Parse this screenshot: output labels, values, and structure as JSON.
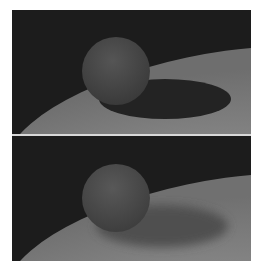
{
  "figure": {
    "panels": [
      {
        "id": "top",
        "description": "Sphere above ground plane with hard, dark shadow",
        "shadow_style": "hard",
        "colors": {
          "background": "#1c1c1c",
          "ground": "#8a8a8a",
          "sphere": "#4a4a4a",
          "shadow": "#2a2a2a"
        }
      },
      {
        "id": "bottom",
        "description": "Sphere above ground plane with soft, lighter shadow",
        "shadow_style": "soft",
        "colors": {
          "background": "#1c1c1c",
          "ground": "#8a8a8a",
          "sphere": "#4e4e4e",
          "shadow": "#555555"
        }
      }
    ],
    "divider_color": "#d8d8d8"
  }
}
